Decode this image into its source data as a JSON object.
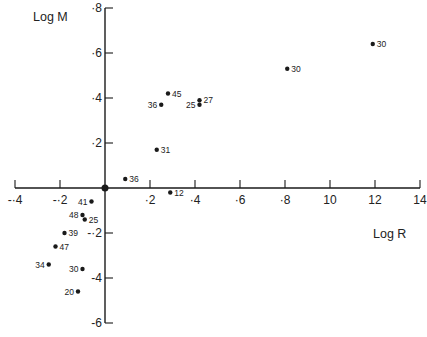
{
  "chart_data": {
    "type": "scatter",
    "title": "",
    "xlabel": "Log R",
    "ylabel": "Log M",
    "xlim": [
      -0.4,
      1.4
    ],
    "ylim": [
      -0.6,
      0.8
    ],
    "grid": false,
    "legend": null,
    "x_ticks": [
      -0.4,
      -0.2,
      0.2,
      0.4,
      0.6,
      0.8,
      1.0,
      1.2,
      1.4
    ],
    "x_tick_labels": [
      "-·4",
      "-·2",
      "·2",
      "·4",
      "·6",
      "·8",
      "10",
      "12",
      "14"
    ],
    "y_ticks": [
      0.8,
      0.6,
      0.4,
      0.2,
      -0.2,
      -0.4,
      -0.6
    ],
    "y_tick_labels": [
      "·8",
      "·6",
      "·4",
      "·2",
      "-·2",
      "-4",
      "-6"
    ],
    "origin_marker": true,
    "points": [
      {
        "label": "30",
        "x": 1.19,
        "y": 0.64,
        "label_side": "right"
      },
      {
        "label": "30",
        "x": 0.81,
        "y": 0.53,
        "label_side": "right"
      },
      {
        "label": "45",
        "x": 0.28,
        "y": 0.42,
        "label_side": "right"
      },
      {
        "label": "36",
        "x": 0.25,
        "y": 0.37,
        "label_side": "left"
      },
      {
        "label": "27",
        "x": 0.42,
        "y": 0.39,
        "label_side": "right"
      },
      {
        "label": "25",
        "x": 0.42,
        "y": 0.37,
        "label_side": "left"
      },
      {
        "label": "31",
        "x": 0.23,
        "y": 0.17,
        "label_side": "right"
      },
      {
        "label": "36",
        "x": 0.09,
        "y": 0.04,
        "label_side": "right"
      },
      {
        "label": "12",
        "x": 0.29,
        "y": -0.02,
        "label_side": "right"
      },
      {
        "label": "41",
        "x": -0.06,
        "y": -0.06,
        "label_side": "left"
      },
      {
        "label": "48",
        "x": -0.1,
        "y": -0.12,
        "label_side": "left"
      },
      {
        "label": "25",
        "x": -0.09,
        "y": -0.14,
        "label_side": "right"
      },
      {
        "label": "39",
        "x": -0.18,
        "y": -0.2,
        "label_side": "right"
      },
      {
        "label": "47",
        "x": -0.22,
        "y": -0.26,
        "label_side": "right"
      },
      {
        "label": "34",
        "x": -0.25,
        "y": -0.34,
        "label_side": "left"
      },
      {
        "label": "30",
        "x": -0.1,
        "y": -0.36,
        "label_side": "left"
      },
      {
        "label": "20",
        "x": -0.12,
        "y": -0.46,
        "label_side": "left"
      }
    ]
  },
  "caption_fragment": "...of the stars for which the masses are not yet known with the observed..."
}
